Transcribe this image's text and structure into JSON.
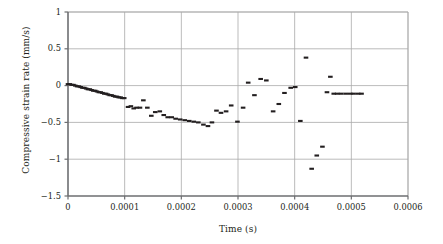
{
  "chart_data": {
    "type": "scatter",
    "title": "",
    "xlabel": "Time (s)",
    "ylabel": "Compressive strain rate (mm/s)",
    "xlim": [
      0,
      0.0006
    ],
    "ylim": [
      -1.5,
      1
    ],
    "xticks": [
      0,
      0.0001,
      0.0002,
      0.0003,
      0.0004,
      0.0005,
      0.0006
    ],
    "xticklabels": [
      "0",
      "0.0001",
      "0.0002",
      "0.0003",
      "0.0004",
      "0.0005",
      "0.0006"
    ],
    "yticks": [
      1,
      0.5,
      0,
      -0.5,
      -1,
      -1.5
    ],
    "yticklabels": [
      "1",
      "0.5",
      "0",
      "−0.5",
      "−1",
      "−1.5"
    ],
    "grid": true,
    "grid_color": "#aaaaaa",
    "axis_color": "#6d6e71",
    "marker_color": "#231f20",
    "marker_shape": "horizontal-dash",
    "legend": null,
    "series": [
      {
        "name": "Compressive strain rate",
        "x": [
          0.0,
          3.2e-06,
          6.4e-06,
          9.6e-06,
          1.28e-05,
          1.6e-05,
          1.92e-05,
          2.24e-05,
          2.56e-05,
          2.88e-05,
          3.2e-05,
          3.52e-05,
          3.84e-05,
          4.16e-05,
          4.48e-05,
          4.8e-05,
          5.12e-05,
          5.44e-05,
          5.76e-05,
          6.08e-05,
          6.4e-05,
          6.72e-05,
          7.04e-05,
          7.36e-05,
          7.68e-05,
          8e-05,
          8.32e-05,
          8.64e-05,
          8.96e-05,
          9.28e-05,
          9.6e-05,
          9.92e-05,
          0.000106,
          0.000111,
          0.000116,
          0.000121,
          0.000127,
          0.000133,
          0.00014,
          0.000147,
          0.000154,
          0.000162,
          0.000169,
          0.000176,
          0.000183,
          0.00019,
          0.000198,
          0.000206,
          0.000214,
          0.000222,
          0.00023,
          0.000239,
          0.000247,
          0.000254,
          0.000262,
          0.00027,
          0.000279,
          0.000288,
          0.000299,
          0.000309,
          0.000318,
          0.000329,
          0.00034,
          0.00035,
          0.000362,
          0.000372,
          0.000382,
          0.000393,
          0.000401,
          0.00041,
          0.00042,
          0.00043,
          0.000439,
          0.000449,
          0.000457,
          0.000463,
          0.000469,
          0.000475,
          0.000482,
          0.00049,
          0.000498,
          0.000504,
          0.000512,
          0.000518
        ],
        "y": [
          0.02,
          0.02,
          0.01,
          0.01,
          0.0,
          -0.01,
          -0.01,
          -0.02,
          -0.03,
          -0.03,
          -0.04,
          -0.05,
          -0.05,
          -0.06,
          -0.07,
          -0.07,
          -0.08,
          -0.09,
          -0.09,
          -0.1,
          -0.11,
          -0.11,
          -0.12,
          -0.13,
          -0.13,
          -0.14,
          -0.15,
          -0.15,
          -0.16,
          -0.16,
          -0.17,
          -0.17,
          -0.29,
          -0.28,
          -0.31,
          -0.3,
          -0.3,
          -0.2,
          -0.3,
          -0.41,
          -0.36,
          -0.35,
          -0.4,
          -0.43,
          -0.43,
          -0.45,
          -0.46,
          -0.47,
          -0.48,
          -0.49,
          -0.5,
          -0.53,
          -0.55,
          -0.5,
          -0.34,
          -0.37,
          -0.35,
          -0.27,
          -0.49,
          -0.3,
          0.04,
          -0.13,
          0.09,
          0.07,
          -0.35,
          -0.25,
          -0.1,
          -0.03,
          -0.02,
          -0.48,
          0.38,
          -1.13,
          -0.95,
          -0.83,
          -0.09,
          0.12,
          -0.11,
          -0.11,
          -0.11,
          -0.11,
          -0.11,
          -0.11,
          -0.11,
          -0.11
        ]
      }
    ]
  }
}
